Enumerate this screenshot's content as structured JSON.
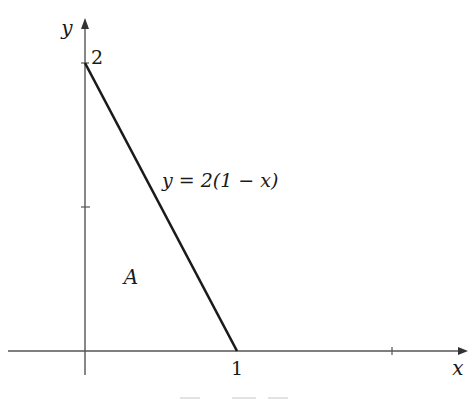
{
  "figure": {
    "type": "region-diagram",
    "colors": {
      "axis": "#555555",
      "line": "#1a1a1a",
      "text": "#1a1a1a",
      "caption_remnant": "#d8d8d8"
    },
    "axes": {
      "x_label": "x",
      "y_label": "y",
      "x_ticks": [
        {
          "value": 1,
          "label": "1"
        },
        {
          "value": 2,
          "label": ""
        }
      ],
      "y_ticks": [
        {
          "value": 1,
          "label": ""
        },
        {
          "value": 2,
          "label": "2"
        }
      ]
    },
    "line": {
      "equation_label": "y = 2(1 − x)",
      "from": [
        0,
        2
      ],
      "to": [
        1,
        0
      ]
    },
    "region": {
      "label": "A",
      "vertices": [
        [
          0,
          0
        ],
        [
          1,
          0
        ],
        [
          0,
          2
        ]
      ]
    }
  }
}
